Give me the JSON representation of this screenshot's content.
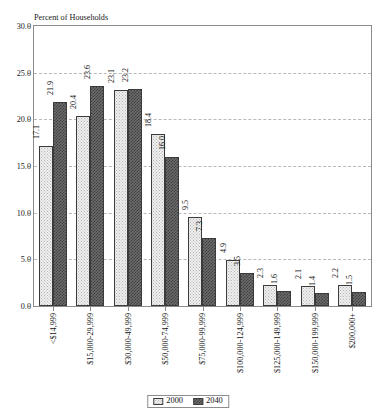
{
  "chart_data": {
    "type": "bar",
    "title": "",
    "xlabel": "",
    "ylabel": "Percent of Households",
    "ylim": [
      0.0,
      30.0
    ],
    "yticks": [
      "0.0",
      "5.0",
      "10.0",
      "15.0",
      "20.0",
      "25.0",
      "30.0"
    ],
    "ytick_values": [
      0.0,
      5.0,
      10.0,
      15.0,
      20.0,
      25.0,
      30.0
    ],
    "grid": true,
    "grid_style": "dashed-horizontal",
    "legend_position": "bottom-center",
    "categories": [
      "<$14,999",
      "$15,000-29,999",
      "$30,000-49,999",
      "$50,000-74,999",
      "$75,000-99,999",
      "$100,000-124,999",
      "$125,000-149,999",
      "$150,000-199,999",
      "$200,000+"
    ],
    "series": [
      {
        "name": "2000",
        "color": "#efefef",
        "values": [
          17.1,
          20.4,
          23.1,
          18.4,
          9.5,
          4.9,
          2.3,
          2.1,
          2.2
        ],
        "labels": [
          "17.1",
          "20.4",
          "23.1",
          "18.4",
          "9.5",
          "4.9",
          "2.3",
          "2.1",
          "2.2"
        ]
      },
      {
        "name": "2040",
        "color": "#5a5a5a",
        "values": [
          21.9,
          23.6,
          23.2,
          16.0,
          7.3,
          3.5,
          1.6,
          1.4,
          1.5
        ],
        "labels": [
          "21.9",
          "23.6",
          "23.2",
          "16.0",
          "7.3",
          "3.5",
          "1.6",
          "1.4",
          "1.5"
        ]
      }
    ]
  },
  "legend": {
    "items": [
      {
        "label": "2000",
        "swatch": "light-dotted-swatch"
      },
      {
        "label": "2040",
        "swatch": "dark-checker-swatch"
      }
    ]
  },
  "colors": {
    "axis": "#8c8c8c",
    "grid": "#b9b9b9",
    "bar_outline": "#3b3b3b",
    "text": "#141414"
  }
}
